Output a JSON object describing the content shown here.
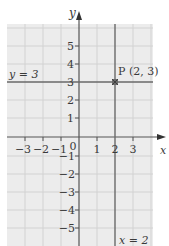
{
  "axes": {
    "x_label": "x",
    "y_label": "y",
    "x_ticks": [
      "−3",
      "−2",
      "−1",
      "0",
      "1",
      "2",
      "3"
    ],
    "y_ticks_pos": [
      "1",
      "2",
      "3",
      "4",
      "5"
    ],
    "y_ticks_neg": [
      "−1",
      "−2",
      "−3",
      "−4",
      "−5"
    ]
  },
  "lines": {
    "horizontal_label": "y = 3",
    "vertical_label": "x = 2"
  },
  "point": {
    "label": "P (2, 3)",
    "x": 2,
    "y": 3
  },
  "colors": {
    "grid_bg": "#ececec",
    "grid_line": "#d0d0d0",
    "axis": "#555555",
    "line": "#6a6a6a",
    "text": "#3a3a3a"
  }
}
